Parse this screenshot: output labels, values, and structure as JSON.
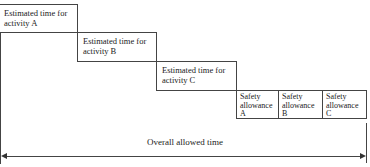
{
  "activities": [
    {
      "id": "A",
      "label": "Estimated time for activity A"
    },
    {
      "id": "B",
      "label": "Estimated time for activity B"
    },
    {
      "id": "C",
      "label": "Estimated time for activity C"
    }
  ],
  "safety_allowances": [
    {
      "id": "A",
      "line1": "Safety",
      "line2": "allowance",
      "line3": "A"
    },
    {
      "id": "B",
      "line1": "Safety",
      "line2": "allowance",
      "line3": "B"
    },
    {
      "id": "C",
      "line1": "Safety",
      "line2": "allowance",
      "line3": "C"
    }
  ],
  "overall": {
    "label": "Overall allowed time"
  }
}
